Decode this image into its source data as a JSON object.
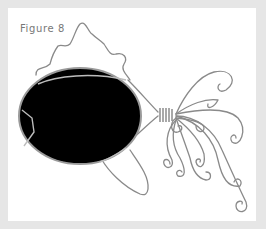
{
  "figure": {
    "caption": "Figure 8",
    "colors": {
      "frame": "#e6e6e6",
      "panel": "#ffffff",
      "caption_text": "#777777",
      "stone": "#000000",
      "wire": "#8a8a8a"
    }
  }
}
